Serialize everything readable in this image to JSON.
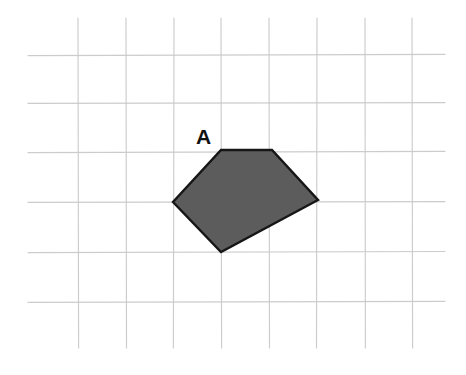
{
  "figure": {
    "kind": "geometry-grid-figure",
    "width": 466,
    "height": 375,
    "background_color": "#ffffff",
    "grid": {
      "line_color": "#c9c9c9",
      "cell_width": 48,
      "cell_height": 49.5,
      "vertical_lines_x": [
        78,
        126,
        174,
        221,
        269,
        317,
        365,
        412
      ],
      "horizontal_lines_y": [
        55,
        103,
        152,
        202,
        252,
        302
      ],
      "vertical_span_y": [
        18,
        348
      ],
      "horizontal_span_x": [
        28,
        445
      ]
    },
    "shapes": [
      {
        "name": "shaded-pentagon",
        "label": "A",
        "label_position": {
          "x": 196,
          "y": 144
        },
        "fill_color": "#5c5c5c",
        "stroke_color": "#161616",
        "vertices": [
          {
            "x": 221,
            "y": 150
          },
          {
            "x": 272,
            "y": 150
          },
          {
            "x": 318,
            "y": 200
          },
          {
            "x": 221,
            "y": 252
          },
          {
            "x": 173,
            "y": 202
          }
        ],
        "points_attr": "221,150 272,150 318,200 221,252 173,202"
      }
    ]
  }
}
